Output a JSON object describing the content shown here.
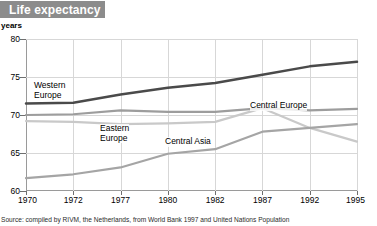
{
  "header": {
    "title": "Life expectancy"
  },
  "axis_unit_label": "years",
  "source_note": "Source: compiled by RIVM, the Netherlands, from World Bank 1997 and United Nations Population",
  "colors": {
    "banner": "#8c8c8c",
    "western_europe": "#4a4a4a",
    "central_europe": "#9d9d9d",
    "eastern_europe": "#c9c9c9",
    "central_asia": "#a5a5a5",
    "grid": "#d7d7d7",
    "axis": "#9a9a9a"
  },
  "series_labels": [
    {
      "name": "Western Europe",
      "text": "Western\nEurope",
      "line1": "Western",
      "line2": "Europe"
    },
    {
      "name": "Central Europe",
      "text": "Central Europe",
      "line1": "Central Europe",
      "line2": ""
    },
    {
      "name": "Eastern Europe",
      "text": "Eastern\nEurope",
      "line1": "Eastern",
      "line2": "Europe"
    },
    {
      "name": "Central Asia",
      "text": "Central Asia",
      "line1": "Central Asia",
      "line2": ""
    }
  ],
  "chart_data": {
    "type": "line",
    "title": "Life expectancy",
    "xlabel": "",
    "ylabel": "years",
    "ylim": [
      60,
      80
    ],
    "yticks": [
      60,
      65,
      70,
      75,
      80
    ],
    "grid": true,
    "legend": "inline-labels",
    "categories": [
      "1970",
      "1972",
      "1977",
      "1980",
      "1982",
      "1987",
      "1992",
      "1995"
    ],
    "x": [
      1970,
      1972,
      1977,
      1980,
      1982,
      1987,
      1992,
      1995
    ],
    "series": [
      {
        "name": "Western Europe",
        "color": "#4a4a4a",
        "values": [
          71.5,
          71.6,
          72.7,
          73.6,
          74.2,
          75.3,
          76.4,
          77.0
        ]
      },
      {
        "name": "Central Europe",
        "color": "#9d9d9d",
        "values": [
          70.0,
          70.1,
          70.6,
          70.4,
          70.4,
          70.9,
          70.6,
          70.8
        ]
      },
      {
        "name": "Eastern Europe",
        "color": "#c9c9c9",
        "values": [
          69.2,
          69.1,
          68.8,
          68.9,
          69.1,
          70.9,
          68.3,
          66.5
        ]
      },
      {
        "name": "Central Asia",
        "color": "#a5a5a5",
        "values": [
          61.7,
          62.2,
          63.1,
          64.9,
          65.5,
          67.8,
          68.3,
          68.8
        ]
      }
    ]
  }
}
